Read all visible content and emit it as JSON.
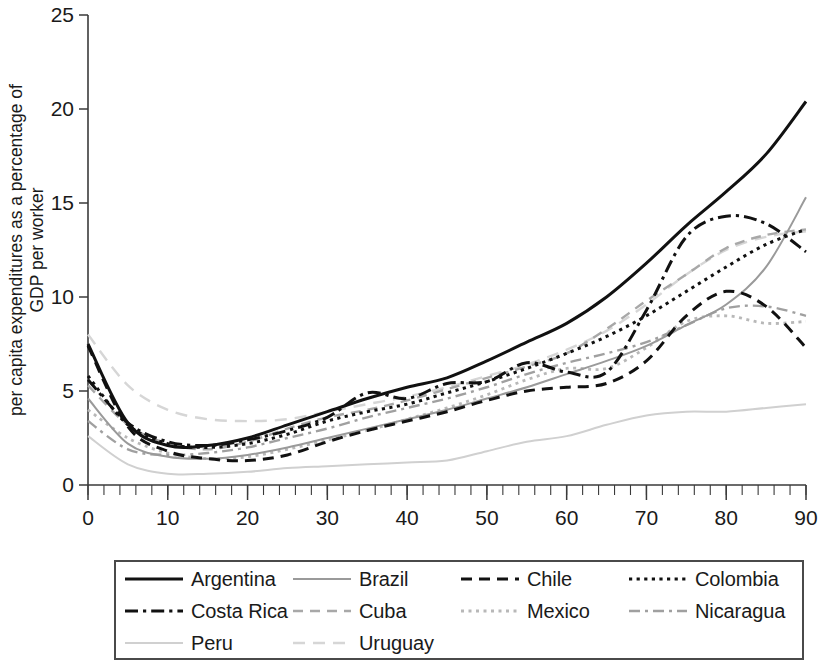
{
  "chart_data": {
    "type": "line",
    "title": "",
    "xlabel": "age",
    "ylabel": "per capita expenditures as a percentage of GDP per worker",
    "ylabel_line1": "per capita expenditures as a percentage of",
    "ylabel_line2": "GDP per worker",
    "xlim": [
      0,
      90
    ],
    "ylim": [
      0,
      25
    ],
    "xticks": [
      0,
      10,
      20,
      30,
      40,
      50,
      60,
      70,
      80,
      90
    ],
    "yticks": [
      0,
      5,
      10,
      15,
      20,
      25
    ],
    "xtick_labels": [
      "0",
      "10",
      "20",
      "30",
      "40",
      "50",
      "60",
      "70",
      "80",
      "90"
    ],
    "ytick_labels": [
      "0",
      "5",
      "10",
      "15",
      "20",
      "25"
    ],
    "x_minor_tick_step": 2,
    "grid": false,
    "legend_position": "below-outside",
    "legend_columns": 4,
    "x": [
      0,
      5,
      10,
      15,
      20,
      25,
      30,
      35,
      40,
      45,
      50,
      55,
      60,
      65,
      70,
      75,
      80,
      85,
      90
    ],
    "series": [
      {
        "name": "Argentina",
        "style": "solid",
        "color": "#111111",
        "width": 3.0,
        "dash": "",
        "values": [
          7.5,
          3.3,
          2.1,
          2.1,
          2.5,
          3.2,
          3.9,
          4.6,
          5.2,
          5.7,
          6.6,
          7.6,
          8.6,
          10.0,
          11.8,
          13.8,
          15.6,
          17.6,
          20.4
        ]
      },
      {
        "name": "Brazil",
        "style": "solid",
        "color": "#9a9a9a",
        "width": 2.0,
        "dash": "",
        "values": [
          4.6,
          2.2,
          1.5,
          1.4,
          1.6,
          2.0,
          2.5,
          3.0,
          3.5,
          4.0,
          4.6,
          5.2,
          5.9,
          6.6,
          7.4,
          8.5,
          9.6,
          11.6,
          15.3
        ]
      },
      {
        "name": "Chile",
        "style": "dashed",
        "color": "#111111",
        "width": 3.0,
        "dash": "11,7",
        "values": [
          7.4,
          3.1,
          1.8,
          1.4,
          1.3,
          1.6,
          2.3,
          2.9,
          3.4,
          3.9,
          4.5,
          5.0,
          5.2,
          5.4,
          6.6,
          9.0,
          10.3,
          9.5,
          7.3
        ]
      },
      {
        "name": "Colombia",
        "style": "dotted",
        "color": "#111111",
        "width": 3.0,
        "dash": "3.2,4.4",
        "values": [
          5.8,
          3.2,
          2.2,
          2.0,
          2.2,
          2.7,
          3.4,
          3.9,
          4.3,
          4.9,
          5.5,
          6.2,
          7.0,
          7.9,
          9.0,
          10.3,
          11.6,
          12.8,
          13.6
        ]
      },
      {
        "name": "Costa Rica",
        "style": "dashdot",
        "color": "#111111",
        "width": 3.0,
        "dash": "13,5,3.2,5",
        "values": [
          5.6,
          3.3,
          2.3,
          2.1,
          2.4,
          2.9,
          3.6,
          4.9,
          4.6,
          5.4,
          5.5,
          6.5,
          6.0,
          6.0,
          9.3,
          13.2,
          14.3,
          13.9,
          12.4
        ]
      },
      {
        "name": "Cuba",
        "style": "dashed",
        "color": "#a8a8a8",
        "width": 2.4,
        "dash": "10,7",
        "values": [
          5.3,
          3.2,
          2.2,
          1.9,
          2.3,
          3.0,
          3.6,
          4.0,
          4.5,
          5.1,
          5.7,
          6.3,
          7.0,
          8.3,
          9.8,
          11.2,
          12.6,
          13.3,
          13.6
        ]
      },
      {
        "name": "Mexico",
        "style": "dotted",
        "color": "#b8b8b8",
        "width": 2.8,
        "dash": "3,4.5",
        "values": [
          4.0,
          2.5,
          1.7,
          1.4,
          1.5,
          1.9,
          2.4,
          2.9,
          3.5,
          4.1,
          4.8,
          5.6,
          6.2,
          6.2,
          7.3,
          8.7,
          9.0,
          8.6,
          8.7
        ]
      },
      {
        "name": "Nicaragua",
        "style": "dashdot",
        "color": "#a0a0a0",
        "width": 2.4,
        "dash": "11,5,3,5",
        "values": [
          3.4,
          1.9,
          1.6,
          1.7,
          2.0,
          2.5,
          3.0,
          3.6,
          4.1,
          4.6,
          5.2,
          5.9,
          6.5,
          7.0,
          7.6,
          8.5,
          9.4,
          9.5,
          9.0
        ]
      },
      {
        "name": "Peru",
        "style": "solid",
        "color": "#d0d0d0",
        "width": 2.0,
        "dash": "",
        "values": [
          2.6,
          1.1,
          0.6,
          0.6,
          0.7,
          0.9,
          1.0,
          1.1,
          1.2,
          1.3,
          1.8,
          2.3,
          2.6,
          3.2,
          3.7,
          3.9,
          3.9,
          4.1,
          4.3
        ]
      },
      {
        "name": "Uruguay",
        "style": "dashed",
        "color": "#d6d6d6",
        "width": 2.4,
        "dash": "12,8",
        "values": [
          8.0,
          5.3,
          4.0,
          3.5,
          3.4,
          3.5,
          3.9,
          4.3,
          4.7,
          5.2,
          5.8,
          6.4,
          7.2,
          8.2,
          9.6,
          11.2,
          12.5,
          13.2,
          13.5
        ]
      }
    ]
  },
  "legend": {
    "items": [
      {
        "label": "Argentina"
      },
      {
        "label": "Brazil"
      },
      {
        "label": "Chile"
      },
      {
        "label": "Colombia"
      },
      {
        "label": "Costa Rica"
      },
      {
        "label": "Cuba"
      },
      {
        "label": "Mexico"
      },
      {
        "label": "Nicaragua"
      },
      {
        "label": "Peru"
      },
      {
        "label": "Uruguay"
      }
    ]
  }
}
